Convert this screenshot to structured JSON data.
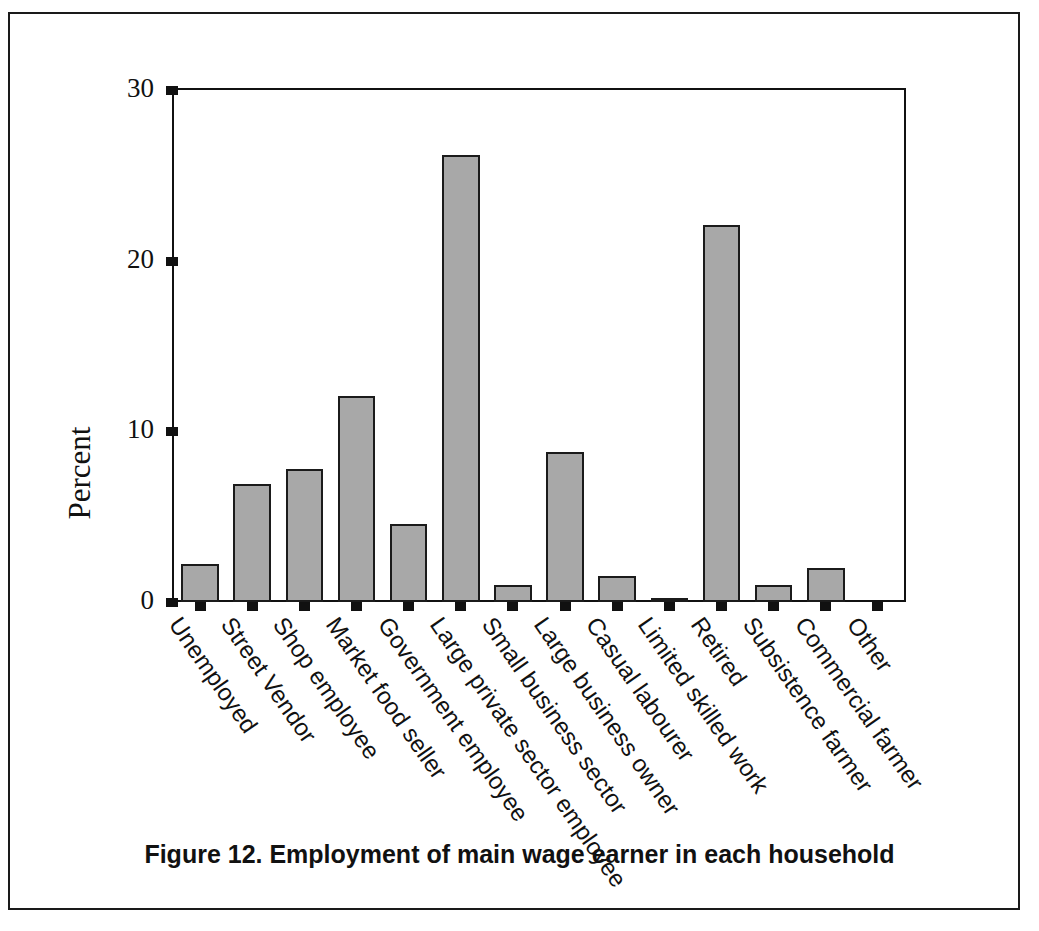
{
  "caption": "Figure 12. Employment of main wage earner in each household",
  "colors": {
    "bar_fill": "#a8a8a8",
    "bar_stroke": "#1b1b1b",
    "axis": "#111111",
    "background": "#ffffff"
  },
  "chart_data": {
    "type": "bar",
    "title": "Figure 12. Employment of main wage earner in each household",
    "xlabel": "",
    "ylabel": "Percent",
    "ylim": [
      0,
      30
    ],
    "yticks": [
      0,
      10,
      20,
      30
    ],
    "ytick_labels": [
      "0",
      "10",
      "20",
      "30"
    ],
    "grid": false,
    "legend": null,
    "orientation": "vertical",
    "xtick_label_rotation": 55,
    "categories": [
      "Unemployed",
      "Street Vendor",
      "Shop employee",
      "Market food seller",
      "Government employee",
      "Large private sector employee",
      "Small business sector",
      "Large business owner",
      "Casual labourer",
      "Limited skilled work",
      "Retired",
      "Subsistence farmer",
      "Commercial farmer",
      "Other"
    ],
    "values": [
      2.2,
      6.9,
      7.8,
      12.1,
      4.6,
      26.2,
      1.0,
      8.8,
      1.5,
      0.2,
      22.1,
      1.0,
      2.0,
      0
    ]
  }
}
